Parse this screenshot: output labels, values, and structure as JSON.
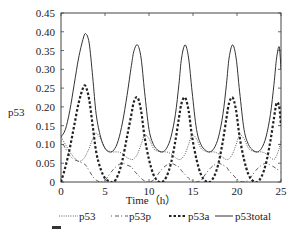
{
  "chart_data": {
    "type": "line",
    "title": "",
    "xlabel": "Time（h）",
    "ylabel": "p53",
    "xlim": [
      0,
      25
    ],
    "ylim": [
      0,
      0.45
    ],
    "xticks": [
      0,
      5,
      10,
      15,
      20,
      25
    ],
    "xtick_labels": [
      "0",
      "5",
      "10",
      "15",
      "20",
      "25"
    ],
    "yticks": [
      0,
      0.05,
      0.1,
      0.15,
      0.2,
      0.25,
      0.3,
      0.35,
      0.4,
      0.45
    ],
    "ytick_labels": [
      "0",
      "0.05",
      "0.10",
      "0.15",
      "0.20",
      "0.25",
      "0.30",
      "0.35",
      "0.40",
      "0.45"
    ],
    "grid": false,
    "legend_position": "bottom",
    "x": [
      0,
      0.5,
      1,
      1.5,
      2,
      2.5,
      2.8,
      3.2,
      3.6,
      4,
      4.5,
      5,
      5.5,
      6,
      6.5,
      7,
      7.5,
      8,
      8.3,
      8.7,
      9.1,
      9.5,
      10,
      10.5,
      11,
      11.5,
      12,
      12.5,
      13,
      13.4,
      13.7,
      14.1,
      14.5,
      14.9,
      15.4,
      15.9,
      16.4,
      16.9,
      17.4,
      17.9,
      18.4,
      18.8,
      19.1,
      19.5,
      19.9,
      20.3,
      20.8,
      21.3,
      21.8,
      22.3,
      22.8,
      23.3,
      23.8,
      24.2,
      24.5,
      24.8,
      25
    ],
    "series": [
      {
        "name": "p53",
        "style": "dotted",
        "values": [
          0.12,
          0.1,
          0.08,
          0.065,
          0.055,
          0.06,
          0.07,
          0.09,
          0.115,
          0.13,
          0.115,
          0.09,
          0.082,
          0.08,
          0.08,
          0.075,
          0.065,
          0.06,
          0.062,
          0.075,
          0.1,
          0.125,
          0.115,
          0.09,
          0.082,
          0.08,
          0.08,
          0.075,
          0.065,
          0.06,
          0.062,
          0.075,
          0.1,
          0.125,
          0.115,
          0.09,
          0.082,
          0.08,
          0.08,
          0.075,
          0.065,
          0.06,
          0.062,
          0.075,
          0.1,
          0.125,
          0.115,
          0.09,
          0.082,
          0.08,
          0.08,
          0.075,
          0.065,
          0.06,
          0.07,
          0.09,
          0.11
        ]
      },
      {
        "name": "p53p",
        "style": "dash-dot",
        "values": [
          0.11,
          0.09,
          0.07,
          0.06,
          0.055,
          0.05,
          0.045,
          0.03,
          0.015,
          0.005,
          0.0,
          0.005,
          0.02,
          0.035,
          0.045,
          0.05,
          0.045,
          0.04,
          0.03,
          0.02,
          0.01,
          0.003,
          0.0,
          0.005,
          0.02,
          0.035,
          0.045,
          0.05,
          0.045,
          0.04,
          0.03,
          0.02,
          0.01,
          0.003,
          0.0,
          0.005,
          0.02,
          0.035,
          0.045,
          0.05,
          0.045,
          0.04,
          0.03,
          0.02,
          0.01,
          0.003,
          0.0,
          0.005,
          0.02,
          0.035,
          0.045,
          0.05,
          0.045,
          0.04,
          0.035,
          0.03,
          0.025
        ]
      },
      {
        "name": "p53a",
        "style": "dashed-bold",
        "values": [
          0.0,
          0.04,
          0.09,
          0.15,
          0.21,
          0.25,
          0.255,
          0.22,
          0.15,
          0.08,
          0.035,
          0.01,
          0.002,
          0.0,
          0.02,
          0.06,
          0.12,
          0.18,
          0.215,
          0.225,
          0.19,
          0.12,
          0.06,
          0.02,
          0.003,
          0.0,
          0.015,
          0.05,
          0.11,
          0.17,
          0.21,
          0.225,
          0.19,
          0.12,
          0.06,
          0.02,
          0.003,
          0.0,
          0.015,
          0.05,
          0.11,
          0.17,
          0.21,
          0.225,
          0.19,
          0.12,
          0.06,
          0.02,
          0.003,
          0.0,
          0.015,
          0.05,
          0.11,
          0.17,
          0.21,
          0.2,
          0.15
        ]
      },
      {
        "name": "p53total",
        "style": "solid",
        "values": [
          0.12,
          0.14,
          0.19,
          0.26,
          0.33,
          0.38,
          0.395,
          0.37,
          0.28,
          0.18,
          0.12,
          0.09,
          0.08,
          0.085,
          0.11,
          0.16,
          0.23,
          0.31,
          0.35,
          0.365,
          0.33,
          0.24,
          0.14,
          0.1,
          0.085,
          0.08,
          0.09,
          0.12,
          0.18,
          0.26,
          0.33,
          0.365,
          0.33,
          0.24,
          0.14,
          0.1,
          0.085,
          0.08,
          0.09,
          0.12,
          0.18,
          0.26,
          0.33,
          0.365,
          0.33,
          0.24,
          0.14,
          0.1,
          0.085,
          0.08,
          0.09,
          0.12,
          0.18,
          0.26,
          0.33,
          0.36,
          0.3
        ]
      }
    ]
  },
  "axes": {
    "xlabel": "Time（h）",
    "ylabel": "p53"
  },
  "legend": {
    "items": [
      {
        "label": "p53",
        "style": "dotted"
      },
      {
        "label": "p53p",
        "style": "dash-dot"
      },
      {
        "label": "p53a",
        "style": "dashed-bold"
      },
      {
        "label": "p53total",
        "style": "solid"
      }
    ]
  },
  "colors": {
    "line": "#222222",
    "frame": "#444444",
    "background": "#ffffff"
  }
}
